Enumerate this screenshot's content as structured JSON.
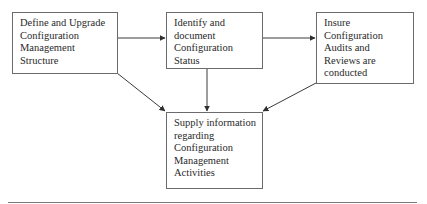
{
  "diagram": {
    "nodes": [
      {
        "id": "define",
        "lines": [
          "Define and Upgrade",
          "Configuration",
          "Management",
          "Structure"
        ]
      },
      {
        "id": "identify",
        "lines": [
          "Identify and",
          "document",
          "Configuration",
          "Status"
        ]
      },
      {
        "id": "insure",
        "lines": [
          "Insure",
          "Configuration",
          "Audits and",
          "Reviews are",
          "conducted"
        ]
      },
      {
        "id": "supply",
        "lines": [
          "Supply information",
          "regarding",
          "Configuration",
          "Management",
          "Activities"
        ]
      }
    ],
    "edges": [
      {
        "from": "define",
        "to": "identify"
      },
      {
        "from": "identify",
        "to": "insure"
      },
      {
        "from": "define",
        "to": "supply"
      },
      {
        "from": "identify",
        "to": "supply"
      },
      {
        "from": "insure",
        "to": "supply"
      }
    ],
    "colors": {
      "stroke": "#3a3a3a",
      "box_border": "#6b6b6b",
      "text": "#2a2a2a"
    }
  }
}
